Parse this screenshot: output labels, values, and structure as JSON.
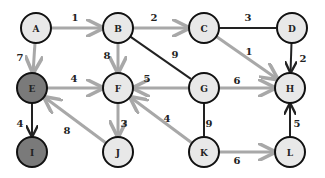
{
  "colors": {
    "node_fill": "#e8e8e8",
    "node_fill_visited": "#7a7a7a",
    "node_stroke": "#111111",
    "edge_light": "#a8a8a8",
    "edge_dark": "#222222"
  },
  "nodes": [
    {
      "id": "A",
      "label": "A",
      "x": 36,
      "y": 28,
      "state": "normal"
    },
    {
      "id": "B",
      "label": "B",
      "x": 118,
      "y": 28,
      "state": "normal"
    },
    {
      "id": "C",
      "label": "C",
      "x": 204,
      "y": 28,
      "state": "normal"
    },
    {
      "id": "D",
      "label": "D",
      "x": 292,
      "y": 28,
      "state": "normal"
    },
    {
      "id": "E",
      "label": "E",
      "x": 32,
      "y": 88,
      "state": "visited"
    },
    {
      "id": "F",
      "label": "F",
      "x": 118,
      "y": 88,
      "state": "normal"
    },
    {
      "id": "G",
      "label": "G",
      "x": 204,
      "y": 88,
      "state": "normal"
    },
    {
      "id": "H",
      "label": "H",
      "x": 290,
      "y": 88,
      "state": "normal"
    },
    {
      "id": "I",
      "label": "I",
      "x": 32,
      "y": 152,
      "state": "visited"
    },
    {
      "id": "J",
      "label": "J",
      "x": 118,
      "y": 152,
      "state": "normal"
    },
    {
      "id": "K",
      "label": "K",
      "x": 204,
      "y": 152,
      "state": "normal"
    },
    {
      "id": "L",
      "label": "L",
      "x": 290,
      "y": 152,
      "state": "normal"
    }
  ],
  "edges": [
    {
      "from": "A",
      "to": "B",
      "weight": "1",
      "style": "light",
      "directed": true,
      "lx": 75,
      "ly": 18
    },
    {
      "from": "B",
      "to": "C",
      "weight": "2",
      "style": "light",
      "directed": true,
      "lx": 154,
      "ly": 18
    },
    {
      "from": "C",
      "to": "D",
      "weight": "3",
      "style": "dark",
      "directed": false,
      "lx": 248,
      "ly": 18
    },
    {
      "from": "C",
      "to": "H",
      "weight": "1",
      "style": "light",
      "directed": true,
      "lx": 249,
      "ly": 52
    },
    {
      "from": "D",
      "to": "H",
      "weight": "2",
      "style": "dark",
      "directed": true,
      "lx": 303,
      "ly": 59
    },
    {
      "from": "A",
      "to": "E",
      "weight": "7",
      "style": "light",
      "directed": true,
      "lx": 20,
      "ly": 58
    },
    {
      "from": "B",
      "to": "F",
      "weight": "8",
      "style": "light",
      "directed": true,
      "lx": 107,
      "ly": 56
    },
    {
      "from": "B",
      "to": "G",
      "weight": "9",
      "style": "dark",
      "directed": false,
      "lx": 175,
      "ly": 55
    },
    {
      "from": "E",
      "to": "F",
      "weight": "4",
      "style": "light",
      "directed": true,
      "lx": 74,
      "ly": 79
    },
    {
      "from": "G",
      "to": "F",
      "weight": "5",
      "style": "light",
      "directed": true,
      "lx": 147,
      "ly": 79
    },
    {
      "from": "G",
      "to": "H",
      "weight": "6",
      "style": "light",
      "directed": true,
      "lx": 237,
      "ly": 81
    },
    {
      "from": "E",
      "to": "I",
      "weight": "4",
      "style": "dark",
      "directed": true,
      "lx": 20,
      "ly": 124
    },
    {
      "from": "J",
      "to": "E",
      "weight": "8",
      "style": "light",
      "directed": true,
      "lx": 67,
      "ly": 131
    },
    {
      "from": "F",
      "to": "J",
      "weight": "3",
      "style": "light",
      "directed": true,
      "lx": 124,
      "ly": 124
    },
    {
      "from": "K",
      "to": "F",
      "weight": "4",
      "style": "light",
      "directed": true,
      "lx": 167,
      "ly": 119
    },
    {
      "from": "G",
      "to": "K",
      "weight": "9",
      "style": "dark",
      "directed": false,
      "lx": 209,
      "ly": 124
    },
    {
      "from": "K",
      "to": "L",
      "weight": "6",
      "style": "light",
      "directed": true,
      "lx": 237,
      "ly": 161
    },
    {
      "from": "L",
      "to": "H",
      "weight": "5",
      "style": "dark",
      "directed": true,
      "lx": 297,
      "ly": 124
    }
  ]
}
